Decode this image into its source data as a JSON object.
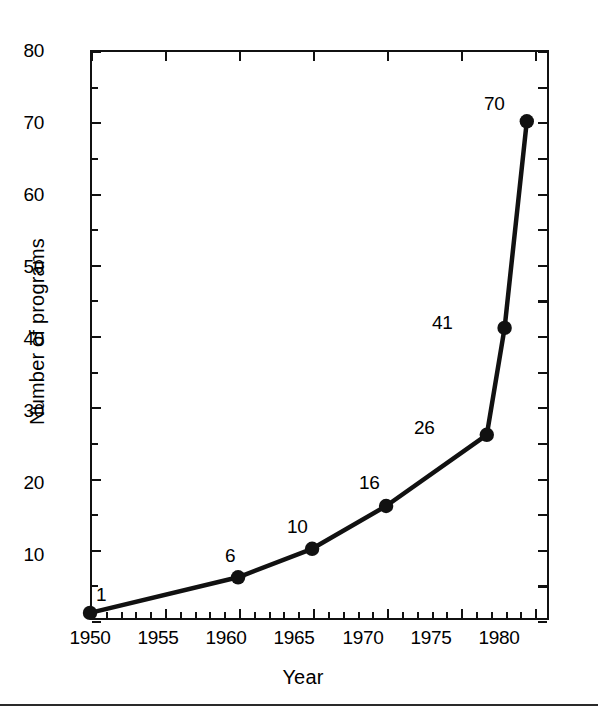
{
  "chart_data": {
    "type": "line",
    "title": "",
    "xlabel": "Year",
    "ylabel": "Number of programs",
    "xlim": [
      1950,
      1981
    ],
    "ylim": [
      0,
      80
    ],
    "grid": false,
    "legend": "none",
    "x_ticks_major": [
      1950,
      1955,
      1960,
      1965,
      1970,
      1975,
      1980
    ],
    "x_tick_labels": [
      "1950",
      "1955",
      "1960",
      "1965",
      "1970",
      "1975",
      "1980"
    ],
    "x_ticks_minor": [
      1951,
      1952,
      1953,
      1954,
      1956,
      1957,
      1958,
      1959,
      1961,
      1962,
      1963,
      1964,
      1966,
      1967,
      1968,
      1969,
      1971,
      1972,
      1973,
      1974,
      1976,
      1977,
      1978,
      1979
    ],
    "y_ticks_major": [
      0,
      10,
      20,
      30,
      40,
      50,
      60,
      70,
      80
    ],
    "y_tick_labels": [
      "",
      "10",
      "20",
      "30",
      "40",
      "50",
      "60",
      "70",
      "80"
    ],
    "y_ticks_minor": [
      5,
      15,
      25,
      35,
      45,
      55,
      65,
      75
    ],
    "series": [
      {
        "name": "Number of programs",
        "x": [
          1950,
          1960,
          1965,
          1970,
          1976.8,
          1978,
          1979.5
        ],
        "values": [
          1,
          6,
          10,
          16,
          26,
          41,
          70
        ],
        "point_labels": [
          "1",
          "6",
          "10",
          "16",
          "26",
          "41",
          "70"
        ],
        "color": "#111111",
        "marker": "filled-circle",
        "line_width": 4
      }
    ]
  },
  "axis_titles": {
    "x": "Year",
    "y": "Number of programs"
  }
}
